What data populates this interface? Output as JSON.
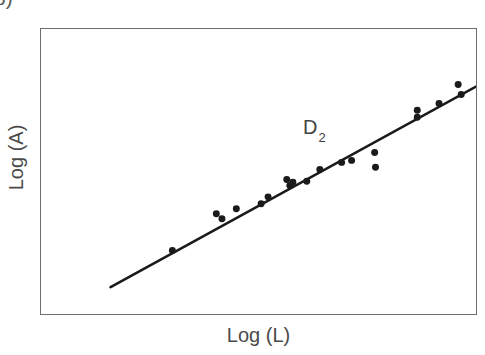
{
  "figure": {
    "panel_letter": "b)",
    "background_color": "#ffffff",
    "frame_color": "#6e6e6e",
    "ink_color": "#1a1a1a",
    "text_color": "#4b4b4b"
  },
  "annotation": {
    "symbol": "D",
    "subscript": "2"
  },
  "chart_data": {
    "type": "scatter",
    "title": "",
    "subtitle": "",
    "xlabel": "Log (L)",
    "ylabel": "Log (A)",
    "xlim": [
      0,
      100
    ],
    "ylim": [
      0,
      100
    ],
    "grid": false,
    "x_ticks": [],
    "y_ticks": [],
    "x_tick_labels": [],
    "y_tick_labels": [],
    "legend": [],
    "legend_position": "none",
    "annotations": [
      {
        "text": "D2",
        "display": "D₂",
        "x": 51.5,
        "y": 76.5
      }
    ],
    "series": [
      {
        "name": "D2",
        "type": "scatter",
        "marker": "circle",
        "marker_size": 7,
        "color": "#1a1a1a",
        "x": [
          30.2,
          40.3,
          41.6,
          44.9,
          50.6,
          52.2,
          56.5,
          57.2,
          57.9,
          61.1,
          64.1,
          69.1,
          71.4,
          76.7,
          76.9,
          86.5,
          86.5,
          91.5,
          95.9,
          96.6
        ],
        "y": [
          22.3,
          35.2,
          33.4,
          36.9,
          38.7,
          41.1,
          47.2,
          45.1,
          46.2,
          46.6,
          50.7,
          53.2,
          53.9,
          56.7,
          51.5,
          71.5,
          69.0,
          73.9,
          80.5,
          77.0
        ]
      },
      {
        "name": "fit-line",
        "type": "line",
        "color": "#1a1a1a",
        "line_width": 2.6,
        "x": [
          16.0,
          100.0
        ],
        "y": [
          9.4,
          79.8
        ],
        "slope_note": "linear regression through scatter"
      }
    ]
  }
}
